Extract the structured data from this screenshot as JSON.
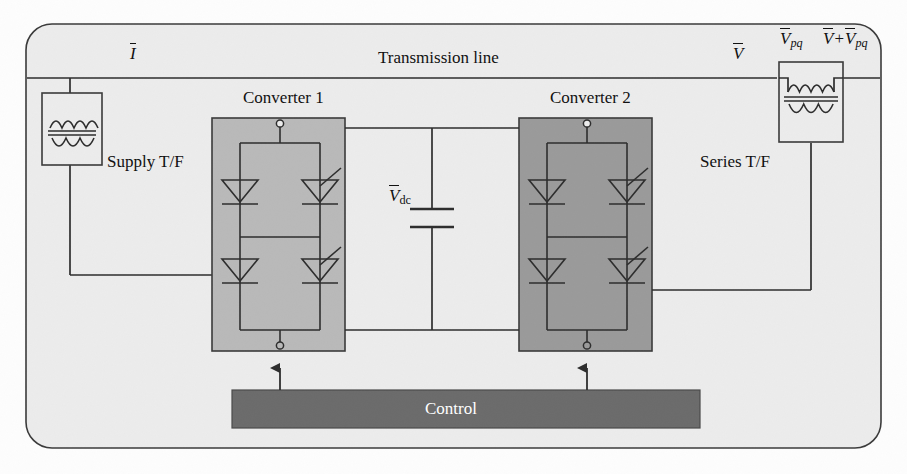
{
  "diagram": {
    "frame": {
      "name": "outer-rounded-frame",
      "fill": "#ececec",
      "stroke": "#3a3a3a"
    },
    "transmission_line": {
      "label": "Transmission line",
      "current_label": {
        "symbol": "I",
        "overbar": true
      },
      "voltage_label": {
        "symbol": "V",
        "overbar": true
      },
      "series_voltage_label": {
        "symbol": "V",
        "sub": "pq",
        "overbar": true
      },
      "sum_voltage_label": {
        "symbol_a": "V",
        "op": "+",
        "symbol_b": "V",
        "sub_b": "pq",
        "overbar": true
      }
    },
    "supply_transformer": {
      "label": "Supply T/F",
      "name": "supply-transformer"
    },
    "series_transformer": {
      "label": "Series T/F",
      "name": "series-transformer"
    },
    "converter1": {
      "label": "Converter 1",
      "fill": "#b9b9b9",
      "stroke": "#3a3a3a"
    },
    "converter2": {
      "label": "Converter 2",
      "fill": "#9a9a9a",
      "stroke": "#3a3a3a"
    },
    "dc_link": {
      "label": {
        "symbol": "V",
        "sub": "dc",
        "overbar": true
      },
      "component": "capacitor"
    },
    "control": {
      "label": "Control",
      "fill": "#6b6b6b",
      "text_color": "#ffffff"
    },
    "devices": {
      "converter1_left": [
        "diode",
        "diode"
      ],
      "converter1_right": [
        "thyristor",
        "thyristor"
      ],
      "converter2_left": [
        "diode",
        "diode"
      ],
      "converter2_right": [
        "thyristor",
        "thyristor"
      ]
    },
    "colors": {
      "line": "#2d2d2d",
      "background": "#ececec",
      "page": "#fdfdfd"
    }
  }
}
